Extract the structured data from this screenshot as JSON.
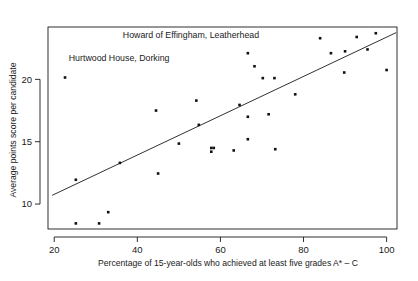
{
  "chart_data": {
    "type": "scatter",
    "title": "",
    "xlabel": "Percentage of 15-year-olds who achieved at least five grades A* – C",
    "ylabel": "Average points score per candidate",
    "xlim": [
      18.5,
      102.5
    ],
    "ylim": [
      8.0,
      24.2
    ],
    "xticks": [
      20,
      40,
      60,
      80,
      100
    ],
    "xtick_labels": [
      "20",
      "40",
      "60",
      "80",
      "100"
    ],
    "yticks": [
      10,
      15,
      20
    ],
    "ytick_labels": [
      "10",
      "15",
      "20"
    ],
    "grid": false,
    "legend": null,
    "point_color": "#111111",
    "line_color": "#1a1a1a",
    "axis_color": "#1a1a1a",
    "background": "#ffffff",
    "x": [
      22.6,
      25.2,
      25.2,
      30.8,
      33.0,
      35.8,
      44.5,
      45.0,
      50.0,
      54.2,
      54.8,
      57.8,
      57.8,
      58.4,
      63.2,
      64.6,
      66.6,
      66.6,
      66.6,
      68.2,
      70.2,
      71.6,
      73.0,
      73.2,
      78.0,
      84.0,
      86.6,
      89.8,
      90.0,
      92.8,
      95.4,
      97.4,
      100.0
    ],
    "y": [
      20.15,
      8.45,
      11.95,
      8.45,
      9.35,
      13.3,
      17.5,
      12.45,
      14.85,
      18.3,
      16.35,
      14.5,
      14.2,
      14.5,
      14.3,
      17.95,
      22.1,
      17.0,
      15.2,
      21.05,
      20.1,
      17.2,
      20.1,
      14.4,
      18.8,
      23.3,
      22.1,
      20.55,
      22.25,
      23.4,
      22.4,
      23.7,
      20.75
    ],
    "trend_line": {
      "x_start": 19.5,
      "y_start": 10.7,
      "x_end": 102.3,
      "y_end": 23.75,
      "visible": true
    },
    "annotations": [
      {
        "text": "Howard of Effingham, Leatherhead",
        "x": 36.5,
        "y": 23.3
      },
      {
        "text": "Hurtwood House, Dorking",
        "x": 23.5,
        "y": 21.45
      }
    ]
  }
}
